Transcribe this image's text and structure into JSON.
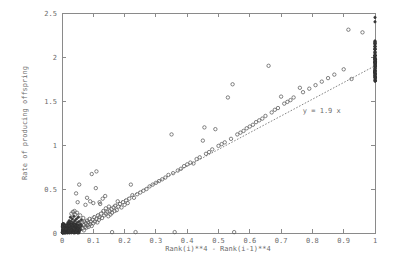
{
  "figure": {
    "background_color": "#ffffff",
    "axis_color": "#8a8a8a",
    "text_color": "#6b6b6b",
    "marker_color": "#5a5a5a",
    "fit_line_color": "#777777"
  },
  "chart_data": {
    "type": "scatter",
    "title": "",
    "xlabel": "Rank(i)**4 - Rank(i-1)**4",
    "ylabel": "Rate of producing offspring",
    "xlim": [
      0,
      1
    ],
    "ylim": [
      0,
      2.5
    ],
    "xticks": [
      0,
      0.1,
      0.2,
      0.3,
      0.4,
      0.5,
      0.6,
      0.7,
      0.8,
      0.9,
      1
    ],
    "xtick_labels": [
      "0",
      "0.1",
      "0.2",
      "0.3",
      "0.4",
      "0.5",
      "0.6",
      "0.7",
      "0.8",
      "0.9",
      "1"
    ],
    "yticks": [
      0,
      0.5,
      1,
      1.5,
      2,
      2.5
    ],
    "ytick_labels": [
      "0",
      "0.5",
      "1",
      "1.5",
      "2",
      "2.5"
    ],
    "grid": false,
    "legend": null,
    "annotations": [
      {
        "text": "y = 1.9 x",
        "x": 0.83,
        "y": 1.36
      }
    ],
    "series": [
      {
        "name": "fit-line",
        "type": "line",
        "style": "dotted",
        "equation": "y = 1.9 x",
        "slope": 1.9,
        "intercept": 0,
        "x": [
          0,
          1
        ],
        "values": [
          0,
          1.9
        ]
      },
      {
        "name": "observations",
        "type": "scatter",
        "marker": "open-circle",
        "points": [
          [
            0.004,
            0.01
          ],
          [
            0.005,
            0.02
          ],
          [
            0.006,
            0.015
          ],
          [
            0.007,
            0.03
          ],
          [
            0.008,
            0.02
          ],
          [
            0.009,
            0.04
          ],
          [
            0.01,
            0.01
          ],
          [
            0.01,
            0.05
          ],
          [
            0.011,
            0.03
          ],
          [
            0.012,
            0.06
          ],
          [
            0.013,
            0.02
          ],
          [
            0.013,
            0.08
          ],
          [
            0.014,
            0.04
          ],
          [
            0.015,
            0.01
          ],
          [
            0.015,
            0.07
          ],
          [
            0.016,
            0.03
          ],
          [
            0.017,
            0.1
          ],
          [
            0.018,
            0.05
          ],
          [
            0.018,
            0.02
          ],
          [
            0.019,
            0.12
          ],
          [
            0.02,
            0.06
          ],
          [
            0.02,
            0.01
          ],
          [
            0.021,
            0.09
          ],
          [
            0.022,
            0.04
          ],
          [
            0.023,
            0.14
          ],
          [
            0.024,
            0.07
          ],
          [
            0.024,
            0.02
          ],
          [
            0.025,
            0.11
          ],
          [
            0.026,
            0.05
          ],
          [
            0.027,
            0.18
          ],
          [
            0.028,
            0.08
          ],
          [
            0.028,
            0.03
          ],
          [
            0.029,
            0.13
          ],
          [
            0.03,
            0.06
          ],
          [
            0.03,
            0.22
          ],
          [
            0.031,
            0.1
          ],
          [
            0.032,
            0.04
          ],
          [
            0.033,
            0.16
          ],
          [
            0.034,
            0.08
          ],
          [
            0.035,
            0.24
          ],
          [
            0.035,
            0.02
          ],
          [
            0.036,
            0.12
          ],
          [
            0.037,
            0.06
          ],
          [
            0.038,
            0.19
          ],
          [
            0.039,
            0.09
          ],
          [
            0.04,
            0.25
          ],
          [
            0.04,
            0.04
          ],
          [
            0.041,
            0.14
          ],
          [
            0.042,
            0.07
          ],
          [
            0.043,
            0.21
          ],
          [
            0.044,
            0.1
          ],
          [
            0.045,
            0.45
          ],
          [
            0.045,
            0.03
          ],
          [
            0.046,
            0.16
          ],
          [
            0.047,
            0.08
          ],
          [
            0.048,
            0.23
          ],
          [
            0.049,
            0.12
          ],
          [
            0.05,
            0.05
          ],
          [
            0.05,
            0.35
          ],
          [
            0.052,
            0.18
          ],
          [
            0.053,
            0.09
          ],
          [
            0.055,
            0.55
          ],
          [
            0.055,
            0.13
          ],
          [
            0.057,
            0.06
          ],
          [
            0.058,
            0.2
          ],
          [
            0.06,
            0.1
          ],
          [
            0.06,
            0.04
          ],
          [
            0.062,
            0.15
          ],
          [
            0.063,
            0.08
          ],
          [
            0.065,
            0.12
          ],
          [
            0.066,
            0.05
          ],
          [
            0.068,
            0.17
          ],
          [
            0.07,
            0.09
          ],
          [
            0.07,
            0.03
          ],
          [
            0.072,
            0.13
          ],
          [
            0.074,
            0.07
          ],
          [
            0.075,
            0.32
          ],
          [
            0.076,
            0.11
          ],
          [
            0.078,
            0.06
          ],
          [
            0.08,
            0.4
          ],
          [
            0.08,
            0.14
          ],
          [
            0.082,
            0.09
          ],
          [
            0.084,
            0.12
          ],
          [
            0.085,
            0.07
          ],
          [
            0.088,
            0.16
          ],
          [
            0.09,
            0.1
          ],
          [
            0.09,
            0.36
          ],
          [
            0.092,
            0.13
          ],
          [
            0.095,
            0.67
          ],
          [
            0.095,
            0.08
          ],
          [
            0.098,
            0.15
          ],
          [
            0.1,
            0.11
          ],
          [
            0.1,
            0.34
          ],
          [
            0.103,
            0.18
          ],
          [
            0.105,
            0.13
          ],
          [
            0.108,
            0.51
          ],
          [
            0.11,
            0.16
          ],
          [
            0.11,
            0.7
          ],
          [
            0.113,
            0.12
          ],
          [
            0.115,
            0.2
          ],
          [
            0.118,
            0.15
          ],
          [
            0.12,
            0.35
          ],
          [
            0.12,
            0.18
          ],
          [
            0.122,
            0.33
          ],
          [
            0.125,
            0.22
          ],
          [
            0.128,
            0.17
          ],
          [
            0.13,
            0.39
          ],
          [
            0.132,
            0.25
          ],
          [
            0.135,
            0.2
          ],
          [
            0.138,
            0.42
          ],
          [
            0.14,
            0.28
          ],
          [
            0.14,
            0.22
          ],
          [
            0.145,
            0.24
          ],
          [
            0.148,
            0.19
          ],
          [
            0.15,
            0.3
          ],
          [
            0.152,
            0.25
          ],
          [
            0.155,
            0.21
          ],
          [
            0.158,
            0.27
          ],
          [
            0.16,
            0.23
          ],
          [
            0.16,
            0.01
          ],
          [
            0.165,
            0.29
          ],
          [
            0.168,
            0.25
          ],
          [
            0.17,
            0.31
          ],
          [
            0.175,
            0.26
          ],
          [
            0.178,
            0.36
          ],
          [
            0.18,
            0.3
          ],
          [
            0.185,
            0.33
          ],
          [
            0.19,
            0.29
          ],
          [
            0.195,
            0.35
          ],
          [
            0.2,
            0.32
          ],
          [
            0.205,
            0.37
          ],
          [
            0.21,
            0.34
          ],
          [
            0.215,
            0.39
          ],
          [
            0.22,
            0.55
          ],
          [
            0.225,
            0.43
          ],
          [
            0.23,
            0.4
          ],
          [
            0.235,
            0.01
          ],
          [
            0.24,
            0.44
          ],
          [
            0.25,
            0.46
          ],
          [
            0.26,
            0.48
          ],
          [
            0.27,
            0.5
          ],
          [
            0.28,
            0.53
          ],
          [
            0.29,
            0.55
          ],
          [
            0.3,
            0.57
          ],
          [
            0.31,
            0.59
          ],
          [
            0.32,
            0.61
          ],
          [
            0.33,
            0.63
          ],
          [
            0.34,
            0.66
          ],
          [
            0.35,
            1.12
          ],
          [
            0.355,
            0.68
          ],
          [
            0.36,
            0.01
          ],
          [
            0.37,
            0.71
          ],
          [
            0.38,
            0.73
          ],
          [
            0.39,
            0.76
          ],
          [
            0.4,
            0.78
          ],
          [
            0.41,
            0.8
          ],
          [
            0.42,
            0.79
          ],
          [
            0.43,
            0.84
          ],
          [
            0.44,
            0.86
          ],
          [
            0.45,
            1.05
          ],
          [
            0.455,
            1.2
          ],
          [
            0.46,
            0.9
          ],
          [
            0.47,
            0.92
          ],
          [
            0.48,
            0.95
          ],
          [
            0.49,
            1.18
          ],
          [
            0.5,
            0.99
          ],
          [
            0.51,
            1.01
          ],
          [
            0.52,
            1.03
          ],
          [
            0.53,
            1.54
          ],
          [
            0.54,
            1.07
          ],
          [
            0.545,
            1.69
          ],
          [
            0.55,
            0.01
          ],
          [
            0.56,
            1.12
          ],
          [
            0.57,
            1.14
          ],
          [
            0.58,
            1.16
          ],
          [
            0.59,
            1.19
          ],
          [
            0.6,
            1.21
          ],
          [
            0.61,
            1.23
          ],
          [
            0.62,
            1.26
          ],
          [
            0.63,
            1.28
          ],
          [
            0.64,
            1.3
          ],
          [
            0.65,
            1.33
          ],
          [
            0.66,
            1.9
          ],
          [
            0.67,
            1.37
          ],
          [
            0.68,
            1.4
          ],
          [
            0.69,
            1.42
          ],
          [
            0.7,
            1.55
          ],
          [
            0.71,
            1.47
          ],
          [
            0.72,
            1.49
          ],
          [
            0.73,
            1.51
          ],
          [
            0.74,
            1.54
          ],
          [
            0.76,
            1.65
          ],
          [
            0.77,
            1.6
          ],
          [
            0.79,
            1.64
          ],
          [
            0.81,
            1.68
          ],
          [
            0.83,
            1.72
          ],
          [
            0.85,
            1.76
          ],
          [
            0.87,
            1.8
          ],
          [
            0.9,
            1.86
          ],
          [
            0.915,
            2.31
          ],
          [
            0.925,
            1.75
          ],
          [
            0.96,
            2.28
          ],
          [
            1.0,
            2.45
          ],
          [
            1.0,
            2.4
          ],
          [
            1.0,
            2.15
          ],
          [
            1.0,
            2.12
          ],
          [
            1.0,
            2.05
          ],
          [
            1.0,
            2.02
          ],
          [
            1.0,
            1.99
          ],
          [
            1.0,
            1.97
          ],
          [
            1.0,
            1.95
          ],
          [
            1.0,
            1.93
          ],
          [
            1.0,
            1.91
          ],
          [
            1.0,
            1.89
          ],
          [
            1.0,
            1.87
          ],
          [
            1.0,
            1.85
          ],
          [
            1.0,
            1.83
          ],
          [
            1.0,
            1.81
          ],
          [
            1.0,
            1.79
          ],
          [
            1.0,
            1.77
          ],
          [
            1.0,
            1.75
          ],
          [
            1.0,
            1.73
          ]
        ]
      }
    ]
  }
}
